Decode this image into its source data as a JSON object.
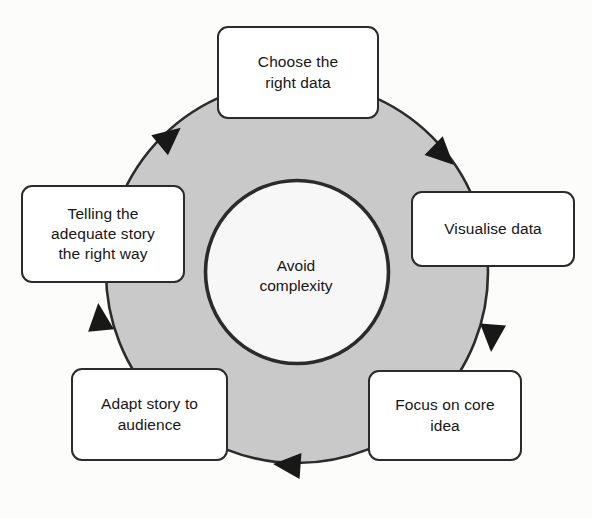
{
  "diagram": {
    "type": "cycle",
    "direction": "clockwise",
    "hub": {
      "label": "Avoid\ncomplexity",
      "fill": "#f7f7f7",
      "stroke": "#2b2b2b"
    },
    "ring": {
      "fill": "#c9c9c9",
      "stroke": "#2b2b2b"
    },
    "nodes": [
      {
        "id": "choose-the-right-data",
        "label": "Choose the\nright data",
        "position": "top"
      },
      {
        "id": "visualise-data",
        "label": "Visualise data",
        "position": "right"
      },
      {
        "id": "focus-on-core-idea",
        "label": "Focus on core\nidea",
        "position": "bottom-right"
      },
      {
        "id": "adapt-story-to-audience",
        "label": "Adapt story to\naudience",
        "position": "bottom-left"
      },
      {
        "id": "telling-the-adequate-story-the-right-way",
        "label": "Telling the\nadequate story\nthe right way",
        "position": "left"
      }
    ],
    "arrows": [
      {
        "id": "arrow-top-left",
        "between": "telling-the-adequate-story-the-right-way → choose-the-right-data"
      },
      {
        "id": "arrow-top-right",
        "between": "choose-the-right-data → visualise-data"
      },
      {
        "id": "arrow-right",
        "between": "visualise-data → focus-on-core-idea"
      },
      {
        "id": "arrow-bottom",
        "between": "focus-on-core-idea → adapt-story-to-audience"
      },
      {
        "id": "arrow-bottom-left",
        "between": "adapt-story-to-audience → telling-the-adequate-story-the-right-way"
      }
    ]
  }
}
